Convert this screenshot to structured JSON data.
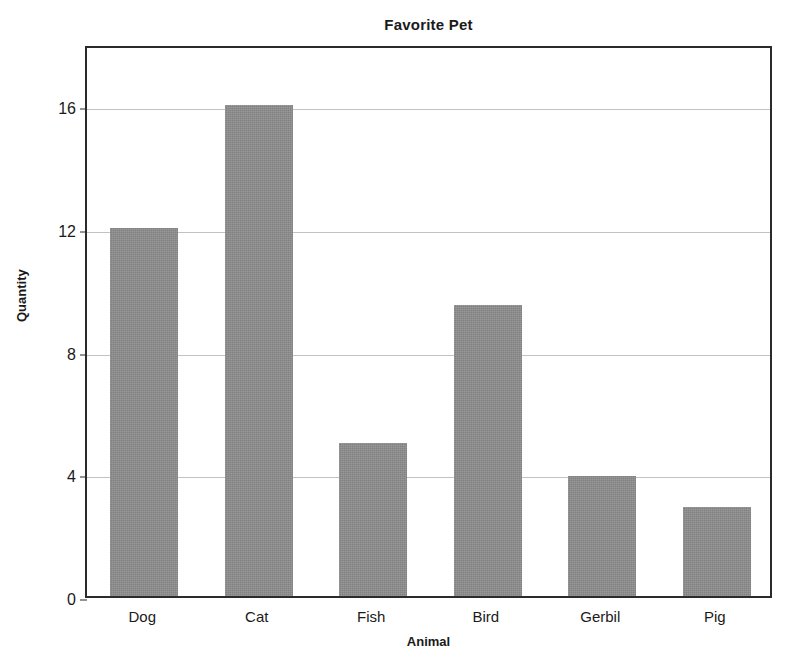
{
  "chart_data": {
    "type": "bar",
    "title": "Favorite Pet",
    "xlabel": "Animal",
    "ylabel": "Quantity",
    "categories": [
      "Dog",
      "Cat",
      "Fish",
      "Bird",
      "Gerbil",
      "Pig"
    ],
    "values": [
      12,
      16,
      5,
      9.5,
      3.9,
      2.9
    ],
    "ylim": [
      0,
      18
    ],
    "yticks": [
      0,
      4,
      8,
      12,
      16
    ],
    "ytick_labels": [
      "0",
      "4",
      "8",
      "12",
      "16"
    ],
    "grid": "horizontal",
    "legend": "none",
    "bar_color": "#8c8c8c",
    "axis_color": "#2b2b2b",
    "grid_color": "#c2c2c2",
    "background_color": "#ffffff"
  }
}
